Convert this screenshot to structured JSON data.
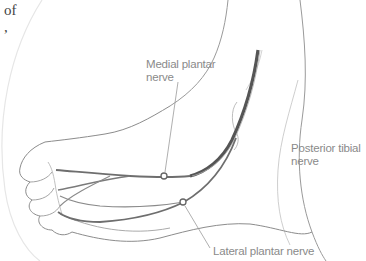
{
  "figure": {
    "partial_text": {
      "line1": "of",
      "line2": ","
    },
    "labels": {
      "medial_plantar": {
        "line1": "Medial plantar",
        "line2": "nerve"
      },
      "posterior_tibial": {
        "line1": "Posterior tibial",
        "line2": "nerve"
      },
      "lateral_plantar": {
        "line1": "Lateral plantar nerve"
      }
    },
    "colors": {
      "outline": "#8c8c8c",
      "nerve": "#6e6e6e",
      "nerve_dark": "#4a4a4a",
      "label": "#8a8a8a",
      "circle_border": "#e0e0e0"
    }
  }
}
